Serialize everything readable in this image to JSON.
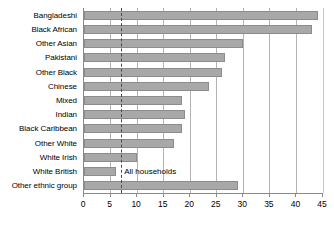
{
  "chart_data": {
    "type": "bar",
    "orientation": "horizontal",
    "title": "",
    "subtitle": "",
    "xlabel": "",
    "ylabel": "",
    "xlim": [
      0,
      45
    ],
    "ylim": null,
    "grid": true,
    "legend": null,
    "xticks": [
      0,
      5,
      10,
      15,
      20,
      25,
      30,
      35,
      40,
      45
    ],
    "xtick_labels": [
      "0",
      "5",
      "10",
      "15",
      "20",
      "25",
      "30",
      "35",
      "40",
      "45"
    ],
    "categories": [
      "Bangladeshi",
      "Black African",
      "Other Asian",
      "Pakistani",
      "Other Black",
      "Chinese",
      "Mixed",
      "Indian",
      "Black Caribbean",
      "Other White",
      "White Irish",
      "White British",
      "Other ethnic group"
    ],
    "values": [
      44,
      43,
      30,
      26.5,
      26,
      23.5,
      18.5,
      19,
      18.5,
      17,
      10,
      6,
      29
    ],
    "bar_color": "#a8a8a8",
    "bar_edge_color": "#8c8c8c",
    "annotations": [
      {
        "text": "All households",
        "type": "reference-line-label",
        "value": 7,
        "line_style": "dashed",
        "line_color": "#4a4a4a"
      }
    ]
  },
  "axis": {
    "tick_color": "#8a8a8a",
    "grid_color": "#b4b4b4"
  }
}
